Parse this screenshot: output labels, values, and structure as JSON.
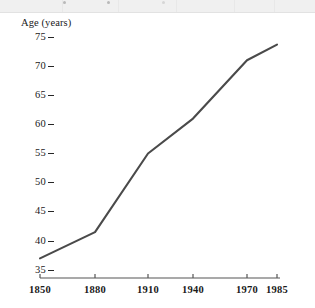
{
  "figure": {
    "background_color": "#ffffff",
    "line_color": "#4a4a4a",
    "axis_color": "#555555",
    "text_color": "#1a1a1a",
    "top_band_color": "#f0f0f0"
  },
  "chart_data": {
    "type": "line",
    "title": "",
    "subtitle": "",
    "xlabel": "",
    "ylabel": "Age (years)",
    "x": [
      1850,
      1880,
      1910,
      1940,
      1970,
      1985
    ],
    "values": [
      37,
      41.5,
      55,
      61,
      71,
      73.7
    ],
    "series": [
      {
        "name": "Life expectancy",
        "x": [
          1850,
          1880,
          1910,
          1940,
          1970,
          1985
        ],
        "values": [
          37,
          41.5,
          55,
          61,
          71,
          73.7
        ]
      }
    ],
    "xtick_labels": [
      "1850",
      "1880",
      "1910",
      "1940",
      "1970",
      "1985"
    ],
    "xtick_values": [
      1850,
      1880,
      1910,
      1940,
      1970,
      1985
    ],
    "ytick_labels": [
      "75",
      "70",
      "65",
      "60",
      "55",
      "50",
      "45",
      "40",
      "35"
    ],
    "ytick_values": [
      75,
      70,
      65,
      60,
      55,
      50,
      45,
      40,
      35
    ],
    "xlim": [
      1850,
      1985
    ],
    "ylim": [
      35,
      76
    ],
    "grid": false,
    "legend": "none",
    "markers": false,
    "annotations": []
  },
  "axis": {
    "y_title": "Age (years)"
  },
  "ticks": {
    "y": [
      {
        "label": "75",
        "py": 37
      },
      {
        "label": "70",
        "py": 66
      },
      {
        "label": "65",
        "py": 95
      },
      {
        "label": "60",
        "py": 124
      },
      {
        "label": "55",
        "py": 153
      },
      {
        "label": "50",
        "py": 182
      },
      {
        "label": "45",
        "py": 211
      },
      {
        "label": "40",
        "py": 241
      },
      {
        "label": "35",
        "py": 270
      }
    ],
    "x": [
      {
        "label": "1850",
        "px": 40
      },
      {
        "label": "1880",
        "px": 95
      },
      {
        "label": "1910",
        "px": 148
      },
      {
        "label": "1940",
        "px": 193
      },
      {
        "label": "1970",
        "px": 247
      },
      {
        "label": "1985",
        "px": 277
      }
    ]
  }
}
